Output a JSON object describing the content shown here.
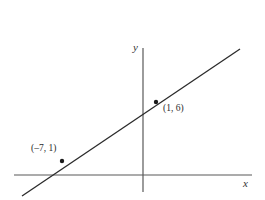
{
  "figure": {
    "width": 265,
    "height": 200,
    "background_color": "#ffffff"
  },
  "axes": {
    "x_label": "x",
    "y_label": "y",
    "axis_color": "#595959",
    "origin": {
      "x": 143,
      "y": 175
    },
    "x_axis": {
      "x1": 14,
      "y1": 175,
      "x2": 252,
      "y2": 175
    },
    "y_axis": {
      "x1": 143,
      "y1": 48,
      "x2": 143,
      "y2": 192
    }
  },
  "line": {
    "color": "#2b2b2b",
    "x1": 22,
    "y1": 196,
    "x2": 240,
    "y2": 49
  },
  "points": [
    {
      "label": "(1, 6)",
      "cx": 156,
      "cy": 102,
      "color": "#1a1a1a"
    },
    {
      "label": "(–7, 1)",
      "cx": 62,
      "cy": 161,
      "color": "#1a1a1a"
    }
  ],
  "chart_data": {
    "type": "line",
    "title": "",
    "xlabel": "x",
    "ylabel": "y",
    "grid": false,
    "legend": null,
    "series": [
      {
        "name": "line through (–7, 1) and (1, 6)",
        "points": [
          {
            "x": -7,
            "y": 1
          },
          {
            "x": 1,
            "y": 6
          }
        ],
        "slope": 0.625,
        "intercept": 5.375,
        "equation": "y = (5/8)x + 43/8"
      }
    ],
    "annotations": [
      {
        "text": "(1, 6)",
        "x": 1,
        "y": 6
      },
      {
        "text": "(–7, 1)",
        "x": -7,
        "y": 1
      }
    ],
    "xlim": [
      -20,
      17
    ],
    "ylim": [
      -3,
      20
    ]
  }
}
